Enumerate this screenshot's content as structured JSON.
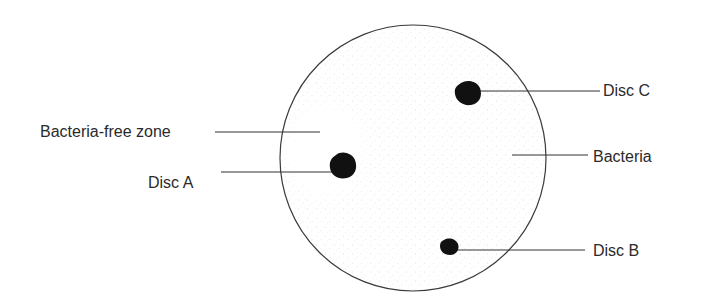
{
  "diagram": {
    "type": "petri-dish-antibiotic-discs",
    "labels": {
      "bacteria_free_zone": "Bacteria-free zone",
      "disc_a": "Disc A",
      "disc_b": "Disc B",
      "disc_c": "Disc C",
      "bacteria": "Bacteria"
    },
    "colors": {
      "outline": "#3a3a3a",
      "disc": "#111111",
      "stipple": "#b8b8b8",
      "text": "#2a2a2a"
    }
  }
}
